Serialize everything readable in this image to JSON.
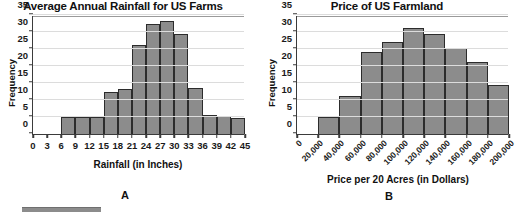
{
  "figure": {
    "panel_a_letter": "A",
    "panel_b_letter": "B"
  },
  "chart_data": [
    {
      "id": "rainfall",
      "type": "bar",
      "title": "Average Annual Rainfall for US Farms",
      "xlabel": "Rainfall (in Inches)",
      "ylabel": "Frequency",
      "xlim": [
        0,
        45
      ],
      "ylim": [
        0,
        35
      ],
      "xticks": [
        "0",
        "3",
        "6",
        "9",
        "12",
        "15",
        "18",
        "21",
        "24",
        "27",
        "30",
        "33",
        "36",
        "39",
        "42",
        "45"
      ],
      "xtick_values": [
        0,
        3,
        6,
        9,
        12,
        15,
        18,
        21,
        24,
        27,
        30,
        33,
        36,
        39,
        42,
        45
      ],
      "yticks": [
        "0",
        "5",
        "10",
        "15",
        "20",
        "25",
        "30",
        "35"
      ],
      "ytick_values": [
        0,
        5,
        10,
        15,
        20,
        25,
        30,
        35
      ],
      "grid": true,
      "bin_width": 3,
      "bins": [
        {
          "start": 6,
          "end": 9,
          "value": 5.1
        },
        {
          "start": 9,
          "end": 12,
          "value": 5.1
        },
        {
          "start": 12,
          "end": 15,
          "value": 5.1
        },
        {
          "start": 15,
          "end": 18,
          "value": 12.3
        },
        {
          "start": 18,
          "end": 21,
          "value": 13.2
        },
        {
          "start": 21,
          "end": 24,
          "value": 26.3
        },
        {
          "start": 24,
          "end": 27,
          "value": 32.3
        },
        {
          "start": 27,
          "end": 30,
          "value": 33.3
        },
        {
          "start": 30,
          "end": 33,
          "value": 29.4
        },
        {
          "start": 33,
          "end": 36,
          "value": 13.4
        },
        {
          "start": 36,
          "end": 39,
          "value": 5.5
        },
        {
          "start": 39,
          "end": 42,
          "value": 5.4
        },
        {
          "start": 42,
          "end": 45,
          "value": 4.6
        }
      ],
      "bar_fill": "#8c8c8c",
      "bar_stroke": "#2c2c2c"
    },
    {
      "id": "farmland-price",
      "type": "bar",
      "title": "Price of US Farmland",
      "xlabel": "Price per 20 Acres (in Dollars)",
      "ylabel": "Frequency",
      "xlim": [
        0,
        200000
      ],
      "ylim": [
        0,
        35
      ],
      "xticks": [
        "0",
        "20,000",
        "40,000",
        "60,000",
        "80,000",
        "100,000",
        "120,000",
        "140,000",
        "160,000",
        "180,000",
        "200,000"
      ],
      "xtick_values": [
        0,
        20000,
        40000,
        60000,
        80000,
        100000,
        120000,
        140000,
        160000,
        180000,
        200000
      ],
      "yticks": [
        "0",
        "5",
        "10",
        "15",
        "20",
        "25",
        "30",
        "35"
      ],
      "ytick_values": [
        0,
        5,
        10,
        15,
        20,
        25,
        30,
        35
      ],
      "grid": true,
      "bin_width": 20000,
      "bins": [
        {
          "start": 20000,
          "end": 40000,
          "value": 5.0
        },
        {
          "start": 40000,
          "end": 60000,
          "value": 11.3
        },
        {
          "start": 60000,
          "end": 80000,
          "value": 24.2
        },
        {
          "start": 80000,
          "end": 100000,
          "value": 27.1
        },
        {
          "start": 100000,
          "end": 120000,
          "value": 31.3
        },
        {
          "start": 120000,
          "end": 140000,
          "value": 29.3
        },
        {
          "start": 140000,
          "end": 160000,
          "value": 25.3
        },
        {
          "start": 160000,
          "end": 180000,
          "value": 21.3
        },
        {
          "start": 180000,
          "end": 200000,
          "value": 14.4
        }
      ],
      "bar_fill": "#8c8c8c",
      "bar_stroke": "#2c2c2c"
    }
  ]
}
